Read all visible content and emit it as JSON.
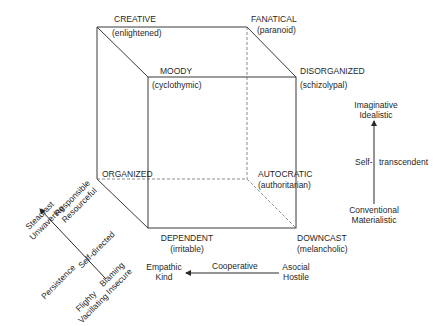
{
  "cube": {
    "vertices": {
      "creative": {
        "title": "CREATIVE",
        "subtitle": "(enlightened)"
      },
      "fanatical": {
        "title": "FANATICAL",
        "subtitle": "(paranoid)"
      },
      "moody": {
        "title": "MOODY",
        "subtitle": "(cyclothymic)"
      },
      "disorganized": {
        "title": "DISORGANIZED",
        "subtitle": "(schizolypal)"
      },
      "organized": {
        "title": "ORGANIZED"
      },
      "autocratic": {
        "title": "AUTOCRATIC",
        "subtitle": "(authoritarian)"
      },
      "dependent": {
        "title": "DEPENDENT",
        "subtitle": "(irritable)"
      },
      "downcast": {
        "title": "DOWNCAST",
        "subtitle": "(melancholic)"
      }
    },
    "line_color": "#3a3a3a",
    "hidden_edge_color": "#8a8a8a"
  },
  "axes": {
    "self_transcendent": {
      "top_line1": "Imaginative",
      "top_line2": "Idealistic",
      "middle_left": "Self-",
      "middle_right": "transcendent",
      "bottom_line1": "Conventional",
      "bottom_line2": "Materialistic"
    },
    "cooperative": {
      "left_line1": "Empathic",
      "left_line2": "Kind",
      "middle": "Cooperative",
      "right_line1": "Asocial",
      "right_line2": "Hostile"
    },
    "self_directed": {
      "top_left_line1": "Steadfast",
      "top_left_line2": "Unwavering",
      "top_right_line1": "Responsible",
      "top_right_line2": "Resourceful",
      "middle_left": "Persistence",
      "middle_right": "Self-directed",
      "bottom_left_line1": "Flighty",
      "bottom_left_line2": "Vacillating",
      "bottom_right_line1": "Blaming",
      "bottom_right_line2": "Insecure"
    }
  }
}
